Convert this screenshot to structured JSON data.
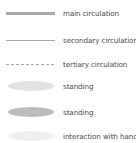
{
  "legend": {
    "items": [
      {
        "symbol": "thick-solid-line",
        "label": "main circulation",
        "color": "#a9a9a9"
      },
      {
        "symbol": "thin-solid-line",
        "label": "secondary circulation",
        "color": "#a9a9a9"
      },
      {
        "symbol": "dashed-line",
        "label": "tertiary circulation",
        "color": "#a9a9a9"
      },
      {
        "symbol": "light-ellipse",
        "label": "standing",
        "color": "#e2e2e2"
      },
      {
        "symbol": "dark-ellipse",
        "label": "standing",
        "color": "#bcbcbc"
      },
      {
        "symbol": "faint-ellipse",
        "label": "interaction with hands",
        "color": "#efefef"
      }
    ]
  }
}
